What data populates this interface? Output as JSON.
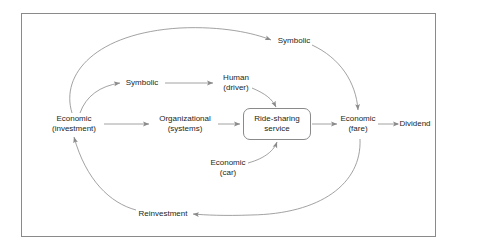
{
  "diagram": {
    "frame_color": "#8a8a8a",
    "line_color": "#8a8a8a",
    "text_color": "#231f20",
    "background": "#ffffff",
    "nodes": [
      {
        "id": "economic_investment",
        "line1": "Economic",
        "line2": "(investment)",
        "x": 74,
        "y": 124,
        "shape": "text"
      },
      {
        "id": "symbolic_mid",
        "line1": "Symbolic",
        "line2": "",
        "x": 142,
        "y": 83,
        "shape": "text"
      },
      {
        "id": "symbolic_top",
        "line1": "Symbolic",
        "line2": "",
        "x": 294,
        "y": 41,
        "shape": "text"
      },
      {
        "id": "human_driver",
        "line1": "Human",
        "line2": "(driver)",
        "x": 236,
        "y": 83,
        "shape": "text"
      },
      {
        "id": "organizational_systems",
        "line1": "Organizational",
        "line2": "(systems)",
        "x": 185,
        "y": 124,
        "shape": "text"
      },
      {
        "id": "ride_sharing_service",
        "line1": "Ride-sharing",
        "line2": "service",
        "x": 277,
        "y": 124,
        "shape": "rounded-box",
        "width": 68,
        "height": 32
      },
      {
        "id": "economic_car",
        "line1": "Economic",
        "line2": "(car)",
        "x": 228,
        "y": 168,
        "shape": "text"
      },
      {
        "id": "economic_fare",
        "line1": "Economic",
        "line2": "(fare)",
        "x": 358,
        "y": 124,
        "shape": "text"
      },
      {
        "id": "dividend",
        "line1": "Dividend",
        "line2": "",
        "x": 415,
        "y": 124,
        "shape": "text"
      },
      {
        "id": "reinvestment",
        "line1": "Reinvestment",
        "line2": "",
        "x": 163,
        "y": 214,
        "shape": "text"
      }
    ],
    "edges": [
      {
        "id": "investment-to-symbolic-top",
        "from": "economic_investment",
        "to": "symbolic_top",
        "style": "curved"
      },
      {
        "id": "investment-to-symbolic-mid",
        "from": "economic_investment",
        "to": "symbolic_mid",
        "style": "curved"
      },
      {
        "id": "symbolic-mid-to-human-driver",
        "from": "symbolic_mid",
        "to": "human_driver",
        "style": "straight"
      },
      {
        "id": "human-driver-to-service",
        "from": "human_driver",
        "to": "ride_sharing_service",
        "style": "curved"
      },
      {
        "id": "investment-to-organizational",
        "from": "economic_investment",
        "to": "organizational_systems",
        "style": "straight"
      },
      {
        "id": "organizational-to-service",
        "from": "organizational_systems",
        "to": "ride_sharing_service",
        "style": "straight"
      },
      {
        "id": "economic-car-to-service",
        "from": "economic_car",
        "to": "ride_sharing_service",
        "style": "curved"
      },
      {
        "id": "service-to-economic-fare",
        "from": "ride_sharing_service",
        "to": "economic_fare",
        "style": "straight"
      },
      {
        "id": "symbolic-top-to-economic-fare",
        "from": "symbolic_top",
        "to": "economic_fare",
        "style": "curved"
      },
      {
        "id": "economic-fare-to-dividend",
        "from": "economic_fare",
        "to": "dividend",
        "style": "straight"
      },
      {
        "id": "economic-fare-to-reinvestment",
        "from": "economic_fare",
        "to": "reinvestment",
        "style": "curved"
      },
      {
        "id": "reinvestment-to-investment",
        "from": "reinvestment",
        "to": "economic_investment",
        "style": "curved"
      }
    ]
  }
}
